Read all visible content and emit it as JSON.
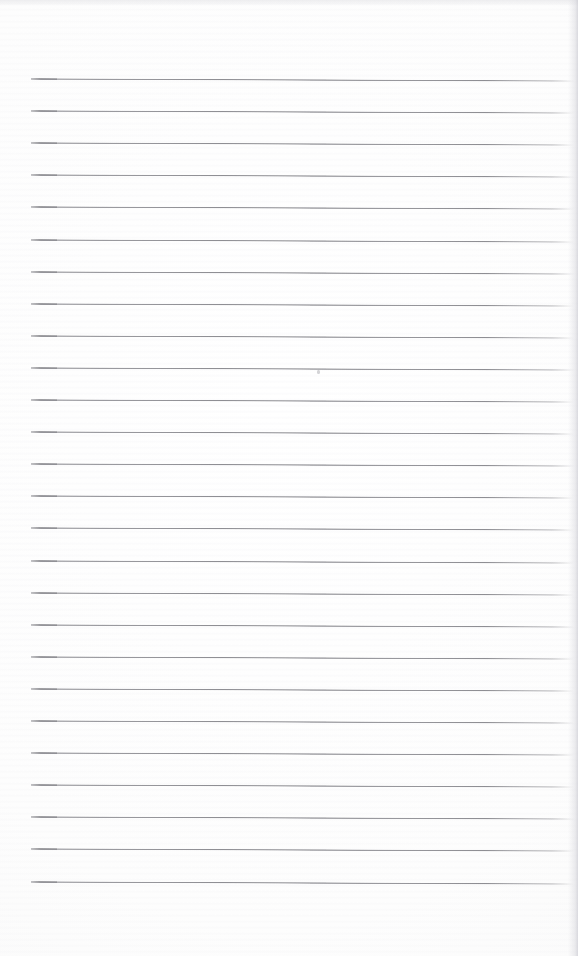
{
  "document": {
    "kind": "scanned-ruled-notebook-page",
    "title": "Blank ruled notebook page",
    "text_content": "",
    "visible_text": [],
    "paper": {
      "width_px": 578,
      "height_px": 956,
      "background_color": "#fdfdfd",
      "edge_tint_color": "#d6d6dc"
    },
    "ruling": {
      "line_color": "#8e8e93",
      "line_accent_color": "#76767b",
      "line_count": 26,
      "first_line_y": 78,
      "line_spacing_px": 32.1,
      "line_start_x": 31,
      "line_end_x": 574,
      "line_thickness_px": 2,
      "slant_degrees": 0.22,
      "top_margin_px": 78,
      "bottom_margin_px": 76,
      "left_margin_px": 31,
      "right_margin_px": 4
    },
    "marks": {
      "speck": {
        "x": 317,
        "y": 370
      }
    }
  }
}
